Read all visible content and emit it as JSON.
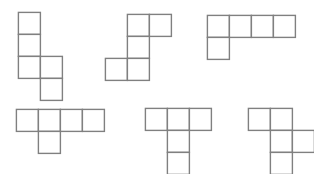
{
  "figure": {
    "background_color": "#ffffff",
    "stroke_color": "#808080",
    "fill_color": "#ffffff",
    "stroke_width": 1.4,
    "cell_size": 22,
    "width": 314,
    "height": 174,
    "shape_count": 6,
    "cells_per_shape": 5
  },
  "shapes": [
    {
      "id": "shape-1",
      "name": "N-pentomino",
      "label": "",
      "x": 17,
      "y": 11,
      "cols": 2,
      "rows": 4,
      "cells": [
        [
          0,
          0
        ],
        [
          0,
          1
        ],
        [
          0,
          2
        ],
        [
          1,
          2
        ],
        [
          1,
          3
        ]
      ]
    },
    {
      "id": "shape-2",
      "name": "S-pentomino",
      "label": "",
      "x": 104,
      "y": 13,
      "cols": 3,
      "rows": 3,
      "cells": [
        [
          1,
          0
        ],
        [
          2,
          0
        ],
        [
          1,
          1
        ],
        [
          0,
          2
        ],
        [
          1,
          2
        ]
      ]
    },
    {
      "id": "shape-3",
      "name": "L-pentomino",
      "label": "",
      "x": 206,
      "y": 14,
      "cols": 4,
      "rows": 2,
      "cells": [
        [
          0,
          0
        ],
        [
          1,
          0
        ],
        [
          2,
          0
        ],
        [
          3,
          0
        ],
        [
          0,
          1
        ]
      ]
    },
    {
      "id": "shape-4",
      "name": "Y-pentomino",
      "label": "",
      "x": 15,
      "y": 108,
      "cols": 4,
      "rows": 2,
      "cells": [
        [
          0,
          0
        ],
        [
          1,
          0
        ],
        [
          2,
          0
        ],
        [
          3,
          0
        ],
        [
          1,
          1
        ]
      ]
    },
    {
      "id": "shape-5",
      "name": "T-pentomino",
      "label": "",
      "x": 144,
      "y": 107,
      "cols": 3,
      "rows": 3,
      "cells": [
        [
          0,
          0
        ],
        [
          1,
          0
        ],
        [
          2,
          0
        ],
        [
          1,
          1
        ],
        [
          1,
          2
        ]
      ]
    },
    {
      "id": "shape-6",
      "name": "F-pentomino",
      "label": "",
      "x": 247,
      "y": 107,
      "cols": 3,
      "rows": 3,
      "cells": [
        [
          0,
          0
        ],
        [
          1,
          0
        ],
        [
          1,
          1
        ],
        [
          2,
          1
        ],
        [
          1,
          2
        ]
      ]
    }
  ]
}
